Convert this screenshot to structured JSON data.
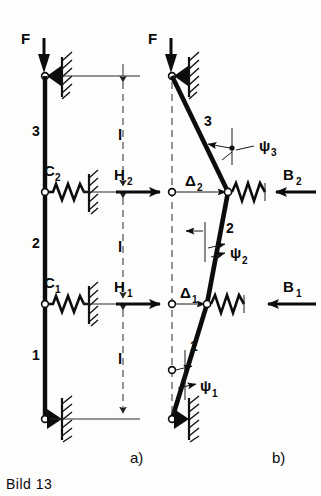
{
  "figure": {
    "caption": "Bild 13",
    "panels": [
      {
        "id": "a",
        "label": "a)"
      },
      {
        "id": "b",
        "label": "b)"
      }
    ]
  },
  "panel_a": {
    "load_label": "F",
    "members": [
      {
        "name": "member-3",
        "label": "3"
      },
      {
        "name": "member-2",
        "label": "2"
      },
      {
        "name": "member-1",
        "label": "1"
      }
    ],
    "springs": [
      {
        "name": "spring-c2",
        "label": "C",
        "sub": "2"
      },
      {
        "name": "spring-c1",
        "label": "C",
        "sub": "1"
      }
    ],
    "dimensions": [
      {
        "name": "length-top",
        "label": "l"
      },
      {
        "name": "length-middle",
        "label": "l"
      },
      {
        "name": "length-bottom",
        "label": "l"
      }
    ]
  },
  "panel_b": {
    "load_label": "F",
    "members": [
      {
        "name": "member-3",
        "label": "3"
      },
      {
        "name": "member-2",
        "label": "2"
      },
      {
        "name": "member-1",
        "label": "1"
      }
    ],
    "forces_left": [
      {
        "name": "force-h2",
        "label": "H",
        "sub": "2"
      },
      {
        "name": "force-h1",
        "label": "H",
        "sub": "1"
      }
    ],
    "forces_right": [
      {
        "name": "force-b2",
        "label": "B",
        "sub": "2"
      },
      {
        "name": "force-b1",
        "label": "B",
        "sub": "1"
      }
    ],
    "displacements": [
      {
        "name": "displacement-delta2",
        "label": "Δ",
        "sub": "2"
      },
      {
        "name": "displacement-delta1",
        "label": "Δ",
        "sub": "1"
      }
    ],
    "angles": [
      {
        "name": "angle-psi3",
        "label": "ψ",
        "sub": "3"
      },
      {
        "name": "angle-psi2",
        "label": "ψ",
        "sub": "2"
      },
      {
        "name": "angle-psi1",
        "label": "ψ",
        "sub": "1"
      }
    ]
  },
  "colors": {
    "ink": "#0c0c0c",
    "paper": "#fdfdfc",
    "thin": "#2a2a2a"
  }
}
